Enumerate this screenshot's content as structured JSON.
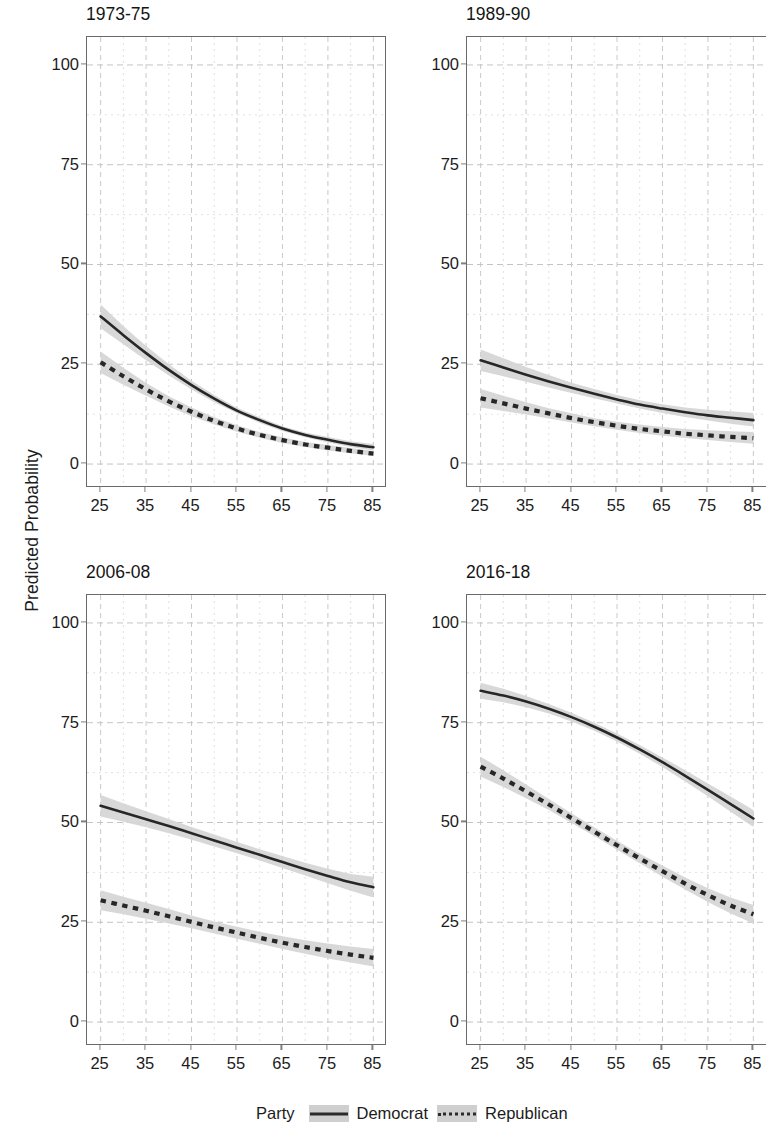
{
  "figure": {
    "ylabel": "Predicted Probability"
  },
  "legend": {
    "title": "Party",
    "entries": [
      {
        "label": "Democrat",
        "style": "solid",
        "color": "#2b2b2b",
        "band_color": "#cfcfcf"
      },
      {
        "label": "Republican",
        "style": "dotted",
        "color": "#2b2b2b",
        "band_color": "#cfcfcf"
      }
    ]
  },
  "chart_data": {
    "type": "line",
    "title": "",
    "xlabel": "",
    "ylabel": "Predicted Probability",
    "xlim": [
      22,
      88
    ],
    "ylim": [
      -6,
      107
    ],
    "xticks": [
      25,
      35,
      45,
      55,
      65,
      75,
      85
    ],
    "yticks": [
      0,
      25,
      50,
      75,
      100
    ],
    "grid": true,
    "minor_grid": true,
    "legend_position": "bottom-center",
    "panel_layout": "2x2",
    "x": [
      25,
      30,
      35,
      40,
      45,
      50,
      55,
      60,
      65,
      70,
      75,
      80,
      85
    ],
    "panels": [
      {
        "title": "1973-75",
        "series": [
          {
            "name": "Democrat",
            "style": "solid",
            "values": [
              37.0,
              32.3,
              27.8,
              23.6,
              19.8,
              16.4,
              13.4,
              11.0,
              8.9,
              7.3,
              6.1,
              5.0,
              4.2
            ],
            "ci_lower": [
              34.0,
              30.0,
              26.0,
              22.2,
              18.7,
              15.5,
              12.7,
              10.3,
              8.3,
              6.7,
              5.4,
              4.3,
              3.4
            ],
            "ci_upper": [
              40.0,
              34.6,
              29.6,
              25.0,
              20.9,
              17.3,
              14.1,
              11.7,
              9.5,
              7.9,
              6.8,
              5.7,
              5.0
            ]
          },
          {
            "name": "Republican",
            "style": "dotted",
            "values": [
              25.5,
              22.0,
              18.7,
              15.7,
              13.1,
              10.8,
              8.9,
              7.3,
              6.0,
              4.9,
              4.1,
              3.3,
              2.6
            ],
            "ci_lower": [
              22.8,
              19.9,
              17.1,
              14.4,
              12.0,
              9.9,
              8.1,
              6.6,
              5.3,
              4.3,
              3.4,
              2.7,
              2.0
            ],
            "ci_upper": [
              28.2,
              24.1,
              20.3,
              17.0,
              14.2,
              11.7,
              9.7,
              8.0,
              6.7,
              5.5,
              4.8,
              4.0,
              3.3
            ]
          }
        ]
      },
      {
        "title": "1989-90",
        "series": [
          {
            "name": "Democrat",
            "style": "solid",
            "values": [
              26.0,
              24.2,
              22.4,
              20.7,
              19.1,
              17.6,
              16.2,
              14.9,
              13.9,
              13.0,
              12.2,
              11.6,
              11.0
            ],
            "ci_lower": [
              23.3,
              22.0,
              20.6,
              19.2,
              17.8,
              16.5,
              15.2,
              13.9,
              12.8,
              11.8,
              10.9,
              10.1,
              9.4
            ],
            "ci_upper": [
              28.7,
              26.5,
              24.3,
              22.3,
              20.4,
              18.8,
              17.3,
              16.0,
              15.0,
              14.2,
              13.6,
              13.2,
              12.8
            ]
          },
          {
            "name": "Republican",
            "style": "dotted",
            "values": [
              16.5,
              15.2,
              13.9,
              12.7,
              11.5,
              10.5,
              9.6,
              8.8,
              8.2,
              7.6,
              7.2,
              6.8,
              6.5
            ],
            "ci_lower": [
              14.2,
              13.3,
              12.4,
              11.4,
              10.4,
              9.5,
              8.6,
              7.8,
              7.1,
              6.5,
              6.0,
              5.5,
              5.1
            ],
            "ci_upper": [
              18.8,
              17.1,
              15.5,
              14.0,
              12.7,
              11.5,
              10.6,
              9.9,
              9.3,
              8.8,
              8.5,
              8.2,
              8.0
            ]
          }
        ]
      },
      {
        "title": "2006-08",
        "series": [
          {
            "name": "Democrat",
            "style": "solid",
            "values": [
              54.2,
              52.5,
              50.8,
              49.1,
              47.3,
              45.5,
              43.7,
              41.9,
              40.1,
              38.3,
              36.6,
              35.0,
              33.8
            ],
            "ci_lower": [
              51.5,
              50.2,
              48.8,
              47.3,
              45.7,
              44.0,
              42.3,
              40.5,
              38.6,
              36.7,
              34.8,
              32.9,
              31.2
            ],
            "ci_upper": [
              56.9,
              54.8,
              52.8,
              50.9,
              48.9,
              47.0,
              45.1,
              43.3,
              41.6,
              39.9,
              38.4,
              37.1,
              36.4
            ]
          },
          {
            "name": "Republican",
            "style": "dotted",
            "values": [
              30.5,
              29.2,
              27.9,
              26.5,
              25.1,
              23.7,
              22.4,
              21.1,
              19.9,
              18.8,
              17.8,
              16.9,
              16.1
            ],
            "ci_lower": [
              28.0,
              27.0,
              25.9,
              24.7,
              23.5,
              22.2,
              20.9,
              19.6,
              18.3,
              17.1,
              15.9,
              14.9,
              13.9
            ],
            "ci_upper": [
              33.0,
              31.4,
              29.9,
              28.3,
              26.7,
              25.2,
              23.9,
              22.6,
              21.5,
              20.5,
              19.7,
              18.9,
              18.3
            ]
          }
        ]
      },
      {
        "title": "2016-18",
        "series": [
          {
            "name": "Democrat",
            "style": "solid",
            "values": [
              83.0,
              81.8,
              80.3,
              78.5,
              76.4,
              74.0,
              71.3,
              68.3,
              65.1,
              61.7,
              58.2,
              54.6,
              51.0
            ],
            "ci_lower": [
              81.0,
              80.1,
              78.9,
              77.3,
              75.3,
              73.0,
              70.3,
              67.2,
              63.9,
              60.3,
              56.6,
              52.7,
              48.9
            ],
            "ci_upper": [
              85.0,
              83.5,
              81.7,
              79.7,
              77.5,
              75.0,
              72.3,
              69.4,
              66.3,
              63.1,
              59.8,
              56.5,
              53.1
            ]
          },
          {
            "name": "Republican",
            "style": "dotted",
            "values": [
              64.0,
              61.0,
              57.8,
              54.5,
              51.1,
              47.7,
              44.3,
              41.0,
              37.8,
              34.7,
              31.8,
              29.2,
              27.0
            ],
            "ci_lower": [
              61.5,
              58.9,
              56.1,
              53.1,
              49.9,
              46.6,
              43.2,
              39.8,
              36.4,
              33.2,
              30.1,
              27.2,
              24.7
            ],
            "ci_upper": [
              66.5,
              63.1,
              59.5,
              55.9,
              52.3,
              48.8,
              45.4,
              42.2,
              39.2,
              36.2,
              33.5,
              31.2,
              29.3
            ]
          }
        ]
      }
    ]
  }
}
